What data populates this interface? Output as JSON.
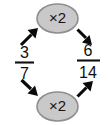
{
  "diagram": {
    "type": "equivalent-fractions",
    "background_color": "#ffffff",
    "left_fraction": {
      "numerator": "3",
      "denominator": "7"
    },
    "right_fraction": {
      "numerator": "6",
      "denominator": "14"
    },
    "operations": [
      {
        "position": "top",
        "label": "×2",
        "fill_color": "#c9c9c9",
        "border_color": "#8e8e8e"
      },
      {
        "position": "bottom",
        "label": "×2",
        "fill_color": "#c9c9c9",
        "border_color": "#8e8e8e"
      }
    ],
    "arrows": [
      {
        "name": "numerator-in",
        "direction": "up-right",
        "color": "#0a0a0a"
      },
      {
        "name": "numerator-out",
        "direction": "down-right",
        "color": "#0a0a0a"
      },
      {
        "name": "denominator-in",
        "direction": "down-right",
        "color": "#0a0a0a"
      },
      {
        "name": "denominator-out",
        "direction": "up-right",
        "color": "#0a0a0a"
      }
    ]
  }
}
